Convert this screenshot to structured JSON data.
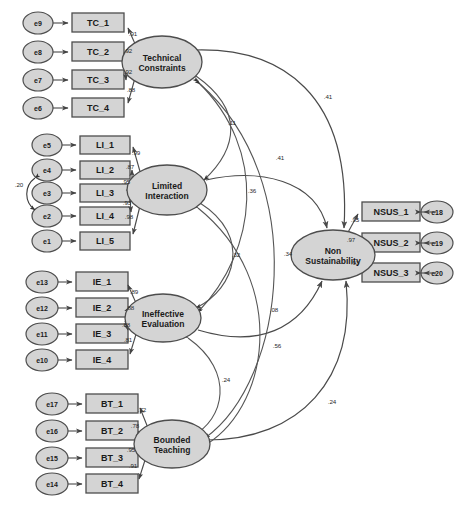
{
  "diagram": {
    "type": "sem-path-diagram",
    "title": "",
    "style": {
      "node_fill": "#d4d4d4",
      "node_stroke": "#4d4d4d",
      "path_stroke": "#555555",
      "background": "#ffffff"
    },
    "errors": [
      {
        "id": "e9",
        "label": "e9",
        "cx": 38,
        "cy": 23,
        "rx": 15,
        "ry": 11
      },
      {
        "id": "e8",
        "label": "e8",
        "cx": 38,
        "cy": 52,
        "rx": 15,
        "ry": 11
      },
      {
        "id": "e7",
        "label": "e7",
        "cx": 38,
        "cy": 80,
        "rx": 15,
        "ry": 11
      },
      {
        "id": "e6",
        "label": "e6",
        "cx": 38,
        "cy": 108,
        "rx": 15,
        "ry": 11
      },
      {
        "id": "e5",
        "label": "e5",
        "cx": 47,
        "cy": 145,
        "rx": 15,
        "ry": 11
      },
      {
        "id": "e4",
        "label": "e4",
        "cx": 47,
        "cy": 170,
        "rx": 15,
        "ry": 11
      },
      {
        "id": "e3",
        "label": "e3",
        "cx": 47,
        "cy": 193,
        "rx": 15,
        "ry": 11
      },
      {
        "id": "e2",
        "label": "e2",
        "cx": 47,
        "cy": 216,
        "rx": 15,
        "ry": 11
      },
      {
        "id": "e1",
        "label": "e1",
        "cx": 47,
        "cy": 241,
        "rx": 15,
        "ry": 11
      },
      {
        "id": "e13",
        "label": "e13",
        "cx": 42,
        "cy": 282,
        "rx": 16,
        "ry": 11
      },
      {
        "id": "e12",
        "label": "e12",
        "cx": 42,
        "cy": 308,
        "rx": 16,
        "ry": 11
      },
      {
        "id": "e11",
        "label": "e11",
        "cx": 42,
        "cy": 334,
        "rx": 16,
        "ry": 11
      },
      {
        "id": "e10",
        "label": "e10",
        "cx": 42,
        "cy": 360,
        "rx": 16,
        "ry": 11
      },
      {
        "id": "e17",
        "label": "e17",
        "cx": 52,
        "cy": 404,
        "rx": 16,
        "ry": 11
      },
      {
        "id": "e16",
        "label": "e16",
        "cx": 52,
        "cy": 431,
        "rx": 16,
        "ry": 11
      },
      {
        "id": "e15",
        "label": "e15",
        "cx": 52,
        "cy": 458,
        "rx": 16,
        "ry": 11
      },
      {
        "id": "e14",
        "label": "e14",
        "cx": 52,
        "cy": 484,
        "rx": 16,
        "ry": 11
      },
      {
        "id": "e18",
        "label": "e18",
        "cx": 437,
        "cy": 212,
        "rx": 16,
        "ry": 11
      },
      {
        "id": "e19",
        "label": "e19",
        "cx": 437,
        "cy": 243,
        "rx": 16,
        "ry": 11
      },
      {
        "id": "e20",
        "label": "e20",
        "cx": 437,
        "cy": 273,
        "rx": 16,
        "ry": 11
      }
    ],
    "indicators": [
      {
        "id": "TC_1",
        "label": "TC_1",
        "x": 72,
        "y": 13,
        "w": 52,
        "h": 19
      },
      {
        "id": "TC_2",
        "label": "TC_2",
        "x": 72,
        "y": 42,
        "w": 52,
        "h": 19
      },
      {
        "id": "TC_3",
        "label": "TC_3",
        "x": 72,
        "y": 70,
        "w": 52,
        "h": 19
      },
      {
        "id": "TC_4",
        "label": "TC_4",
        "x": 72,
        "y": 98,
        "w": 52,
        "h": 19
      },
      {
        "id": "LI_1",
        "label": "LI_1",
        "x": 80,
        "y": 136,
        "w": 50,
        "h": 18
      },
      {
        "id": "LI_2",
        "label": "LI_2",
        "x": 80,
        "y": 161,
        "w": 50,
        "h": 18
      },
      {
        "id": "LI_3",
        "label": "LI_3",
        "x": 80,
        "y": 184,
        "w": 50,
        "h": 18
      },
      {
        "id": "LI_4",
        "label": "LI_4",
        "x": 80,
        "y": 207,
        "w": 50,
        "h": 18
      },
      {
        "id": "LI_5",
        "label": "LI_5",
        "x": 80,
        "y": 232,
        "w": 50,
        "h": 18
      },
      {
        "id": "IE_1",
        "label": "IE_1",
        "x": 76,
        "y": 272,
        "w": 52,
        "h": 19
      },
      {
        "id": "IE_2",
        "label": "IE_2",
        "x": 76,
        "y": 298,
        "w": 52,
        "h": 19
      },
      {
        "id": "IE_3",
        "label": "IE_3",
        "x": 76,
        "y": 324,
        "w": 52,
        "h": 19
      },
      {
        "id": "IE_4",
        "label": "IE_4",
        "x": 76,
        "y": 350,
        "w": 52,
        "h": 19
      },
      {
        "id": "BT_1",
        "label": "BT_1",
        "x": 86,
        "y": 394,
        "w": 52,
        "h": 19
      },
      {
        "id": "BT_2",
        "label": "BT_2",
        "x": 86,
        "y": 421,
        "w": 52,
        "h": 19
      },
      {
        "id": "BT_3",
        "label": "BT_3",
        "x": 86,
        "y": 448,
        "w": 52,
        "h": 19
      },
      {
        "id": "BT_4",
        "label": "BT_4",
        "x": 86,
        "y": 474,
        "w": 52,
        "h": 19
      },
      {
        "id": "NSUS_1",
        "label": "NSUS_1",
        "x": 362,
        "y": 202,
        "w": 58,
        "h": 19
      },
      {
        "id": "NSUS_2",
        "label": "NSUS_2",
        "x": 362,
        "y": 233,
        "w": 58,
        "h": 19
      },
      {
        "id": "NSUS_3",
        "label": "NSUS_3",
        "x": 362,
        "y": 263,
        "w": 58,
        "h": 19
      }
    ],
    "latents": [
      {
        "id": "TC",
        "line1": "Technical",
        "line2": "Constraints",
        "cx": 162,
        "cy": 62,
        "rx": 40,
        "ry": 26
      },
      {
        "id": "LI",
        "line1": "Limited",
        "line2": "Interaction",
        "cx": 167,
        "cy": 190,
        "rx": 40,
        "ry": 25
      },
      {
        "id": "IE",
        "line1": "Ineffective",
        "line2": "Evaluation",
        "cx": 163,
        "cy": 318,
        "rx": 38,
        "ry": 24
      },
      {
        "id": "BT",
        "line1": "Bounded",
        "line2": "Teaching",
        "cx": 172,
        "cy": 444,
        "rx": 38,
        "ry": 24
      },
      {
        "id": "NSUS",
        "line1": "Non",
        "line2": "Sustainability",
        "cx": 333,
        "cy": 255,
        "rx": 42,
        "ry": 25
      }
    ],
    "loadings": [
      {
        "from": "TC",
        "to": "TC_1",
        "value": ".91",
        "lx": 133,
        "ly": 36
      },
      {
        "from": "TC",
        "to": "TC_2",
        "value": ".92",
        "lx": 128,
        "ly": 53
      },
      {
        "from": "TC",
        "to": "TC_3",
        "value": ".92",
        "lx": 128,
        "ly": 74
      },
      {
        "from": "TC",
        "to": "TC_4",
        "value": ".88",
        "lx": 131,
        "ly": 92
      },
      {
        "from": "LI",
        "to": "LI_1",
        "value": ".99",
        "lx": 136,
        "ly": 155
      },
      {
        "from": "LI",
        "to": "LI_2",
        "value": ".87",
        "lx": 130,
        "ly": 169
      },
      {
        "from": "LI",
        "to": "LI_3",
        "value": ".95",
        "lx": 126,
        "ly": 184
      },
      {
        "from": "LI",
        "to": "LI_4",
        "value": ".93",
        "lx": 127,
        "ly": 205
      },
      {
        "from": "LI",
        "to": "LI_5",
        "value": ".98",
        "lx": 129,
        "ly": 219
      },
      {
        "from": "IE",
        "to": "IE_1",
        "value": ".89",
        "lx": 134,
        "ly": 294
      },
      {
        "from": "IE",
        "to": "IE_2",
        "value": ".88",
        "lx": 130,
        "ly": 310
      },
      {
        "from": "IE",
        "to": "IE_3",
        "value": ".88",
        "lx": 126,
        "ly": 327
      },
      {
        "from": "IE",
        "to": "IE_4",
        "value": ".81",
        "lx": 128,
        "ly": 342
      },
      {
        "from": "BT",
        "to": "BT_1",
        "value": ".72",
        "lx": 142,
        "ly": 412
      },
      {
        "from": "BT",
        "to": "BT_2",
        "value": ".78",
        "lx": 135,
        "ly": 428
      },
      {
        "from": "BT",
        "to": "BT_3",
        "value": ".95",
        "lx": 131,
        "ly": 452
      },
      {
        "from": "BT",
        "to": "BT_4",
        "value": ".91",
        "lx": 133,
        "ly": 468
      },
      {
        "from": "NSUS",
        "to": "NSUS_1",
        "value": ".95",
        "lx": 355,
        "ly": 222
      },
      {
        "from": "NSUS",
        "to": "NSUS_2",
        "value": ".97",
        "lx": 351,
        "ly": 242
      },
      {
        "from": "NSUS",
        "to": "NSUS_3",
        "value": ".93",
        "lx": 355,
        "ly": 265
      }
    ],
    "structural_paths": [
      {
        "from": "TC",
        "to": "NSUS",
        "value": ".41",
        "lx": 328,
        "ly": 99
      },
      {
        "from": "LI",
        "to": "NSUS",
        "value": ".41",
        "lx": 280,
        "ly": 160
      },
      {
        "from": "IE",
        "to": "NSUS",
        "value": ".08",
        "lx": 274,
        "ly": 312
      },
      {
        "from": "BT",
        "to": "NSUS",
        "value": ".24",
        "lx": 332,
        "ly": 404
      }
    ],
    "covariances": [
      {
        "between": [
          "e4",
          "e2"
        ],
        "value": ".20",
        "lx": 19,
        "ly": 187
      },
      {
        "between": [
          "TC",
          "LI"
        ],
        "value": ".11",
        "lx": 232,
        "ly": 125
      },
      {
        "between": [
          "TC",
          "IE"
        ],
        "value": ".36",
        "lx": 252,
        "ly": 193
      },
      {
        "between": [
          "TC",
          "BT"
        ],
        "value": ".34",
        "lx": 288,
        "ly": 256
      },
      {
        "between": [
          "LI",
          "IE"
        ],
        "value": ".32",
        "lx": 236,
        "ly": 257
      },
      {
        "between": [
          "LI",
          "BT"
        ],
        "value": ".56",
        "lx": 277,
        "ly": 348
      },
      {
        "between": [
          "IE",
          "BT"
        ],
        "value": ".24",
        "lx": 226,
        "ly": 382
      }
    ]
  }
}
